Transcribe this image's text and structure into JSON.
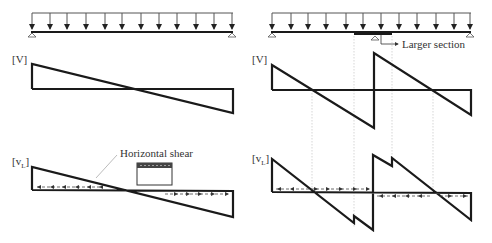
{
  "left_panel": {
    "shear_label": "[V]",
    "vl_label": "[v",
    "vl_sub": "L",
    "vl_close": "]",
    "annotation": "Horizontal shear"
  },
  "right_panel": {
    "shear_label": "[V]",
    "vl_label": "[v",
    "vl_sub": "L",
    "vl_close": "]",
    "annotation": "Larger section"
  },
  "colors": {
    "line": "#1a1a1a",
    "thin": "#555555",
    "guide": "#bdbdbd"
  }
}
